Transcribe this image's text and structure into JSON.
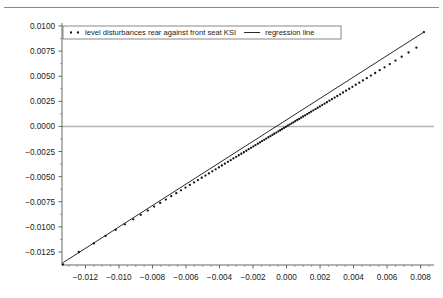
{
  "chart_data": {
    "type": "scatter",
    "title": "",
    "subtitle": "",
    "xlabel": "",
    "ylabel": "",
    "xlim": [
      -0.0134,
      0.0088
    ],
    "ylim": [
      -0.0138,
      0.0103
    ],
    "xticks": [
      -0.012,
      -0.01,
      -0.008,
      -0.006,
      -0.004,
      -0.002,
      0.0,
      0.002,
      0.004,
      0.006,
      0.008
    ],
    "xtick_labels": [
      "−0.012",
      "−0.010",
      "−0.008",
      "−0.006",
      "−0.004",
      "−0.002",
      "0.000",
      "0.002",
      "0.004",
      "0.006",
      "0.008"
    ],
    "yticks": [
      -0.0125,
      -0.01,
      -0.0075,
      -0.005,
      -0.0025,
      0.0,
      0.0025,
      0.005,
      0.0075,
      0.01
    ],
    "ytick_labels": [
      "−0.0125",
      "−0.0100",
      "−0.0075",
      "−0.0050",
      "−0.0025",
      "0.0000",
      "0.0025",
      "0.0050",
      "0.0075",
      "0.0100"
    ],
    "minor_ticks": true,
    "grid": false,
    "zero_line": {
      "y": 0.0,
      "color": "#b4b4b4"
    },
    "legend_position": "top-left",
    "series": [
      {
        "name": "level disturbances rear against front seat KSI",
        "type": "scatter",
        "marker": "dot",
        "color": "#111111",
        "points": [
          [
            -0.01335,
            -0.01375
          ],
          [
            -0.0124,
            -0.0125
          ],
          [
            -0.0115,
            -0.01165
          ],
          [
            -0.0108,
            -0.0109
          ],
          [
            -0.0102,
            -0.0103
          ],
          [
            -0.00965,
            -0.00975
          ],
          [
            -0.00915,
            -0.00925
          ],
          [
            -0.0087,
            -0.0088
          ],
          [
            -0.00828,
            -0.00838
          ],
          [
            -0.0079,
            -0.00798
          ],
          [
            -0.00754,
            -0.00762
          ],
          [
            -0.0072,
            -0.00728
          ],
          [
            -0.00688,
            -0.00695
          ],
          [
            -0.00658,
            -0.00665
          ],
          [
            -0.0063,
            -0.00636
          ],
          [
            -0.00603,
            -0.00609
          ],
          [
            -0.00577,
            -0.00583
          ],
          [
            -0.00552,
            -0.00558
          ],
          [
            -0.00529,
            -0.00534
          ],
          [
            -0.00506,
            -0.00511
          ],
          [
            -0.00484,
            -0.00489
          ],
          [
            -0.00463,
            -0.00468
          ],
          [
            -0.00443,
            -0.00447
          ],
          [
            -0.00423,
            -0.00427
          ],
          [
            -0.00404,
            -0.00408
          ],
          [
            -0.00386,
            -0.00389
          ],
          [
            -0.00368,
            -0.00371
          ],
          [
            -0.0035,
            -0.00353
          ],
          [
            -0.00333,
            -0.00336
          ],
          [
            -0.00317,
            -0.00319
          ],
          [
            -0.00301,
            -0.00303
          ],
          [
            -0.00285,
            -0.00287
          ],
          [
            -0.0027,
            -0.00272
          ],
          [
            -0.00255,
            -0.00257
          ],
          [
            -0.0024,
            -0.00242
          ],
          [
            -0.00226,
            -0.00227
          ],
          [
            -0.00212,
            -0.00213
          ],
          [
            -0.00198,
            -0.00199
          ],
          [
            -0.00185,
            -0.00186
          ],
          [
            -0.00171,
            -0.00172
          ],
          [
            -0.00158,
            -0.00159
          ],
          [
            -0.00146,
            -0.00146
          ],
          [
            -0.00133,
            -0.00133
          ],
          [
            -0.00121,
            -0.00121
          ],
          [
            -0.00108,
            -0.00108
          ],
          [
            -0.00096,
            -0.00096
          ],
          [
            -0.00084,
            -0.00084
          ],
          [
            -0.00073,
            -0.00073
          ],
          [
            -0.00061,
            -0.00061
          ],
          [
            -0.00049,
            -0.00049
          ],
          [
            -0.00038,
            -0.00038
          ],
          [
            -0.00027,
            -0.00027
          ],
          [
            -0.00015,
            -0.00015
          ],
          [
            -4e-05,
            -4e-05
          ],
          [
            7e-05,
            7e-05
          ],
          [
            0.00018,
            0.00018
          ],
          [
            0.0003,
            0.0003
          ],
          [
            0.00041,
            0.00041
          ],
          [
            0.00052,
            0.00052
          ],
          [
            0.00064,
            0.00064
          ],
          [
            0.00075,
            0.00075
          ],
          [
            0.00087,
            0.00087
          ],
          [
            0.00099,
            0.00099
          ],
          [
            0.00111,
            0.00111
          ],
          [
            0.00123,
            0.00123
          ],
          [
            0.00135,
            0.00135
          ],
          [
            0.00147,
            0.00147
          ],
          [
            0.0016,
            0.0016
          ],
          [
            0.00173,
            0.00173
          ],
          [
            0.00186,
            0.00186
          ],
          [
            0.00199,
            0.00199
          ],
          [
            0.00213,
            0.00213
          ],
          [
            0.00227,
            0.00227
          ],
          [
            0.00241,
            0.00241
          ],
          [
            0.00256,
            0.00256
          ],
          [
            0.00271,
            0.00271
          ],
          [
            0.00287,
            0.00287
          ],
          [
            0.00303,
            0.00303
          ],
          [
            0.0032,
            0.0032
          ],
          [
            0.00337,
            0.00338
          ],
          [
            0.00355,
            0.00356
          ],
          [
            0.00374,
            0.00375
          ],
          [
            0.00393,
            0.00394
          ],
          [
            0.00413,
            0.00415
          ],
          [
            0.00434,
            0.00436
          ],
          [
            0.00456,
            0.00458
          ],
          [
            0.00479,
            0.00481
          ],
          [
            0.00503,
            0.00506
          ],
          [
            0.00529,
            0.00532
          ],
          [
            0.00556,
            0.0056
          ],
          [
            0.00585,
            0.00589
          ],
          [
            0.00616,
            0.00621
          ],
          [
            0.0065,
            0.00656
          ],
          [
            0.00687,
            0.00694
          ],
          [
            0.00728,
            0.00736
          ],
          [
            0.00775,
            0.00784
          ],
          [
            0.0082,
            0.0094
          ]
        ]
      },
      {
        "name": "regression line",
        "type": "line",
        "color": "#111111",
        "x_from": -0.01335,
        "y_from": -0.01358,
        "x_to": 0.0082,
        "y_to": 0.0094
      }
    ]
  },
  "legend": {
    "entries": [
      {
        "label": "level disturbances rear against front seat KSI",
        "marker": "dot"
      },
      {
        "label": "regression line",
        "marker": "line"
      }
    ]
  }
}
